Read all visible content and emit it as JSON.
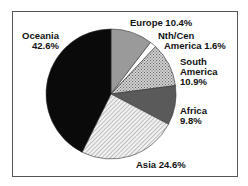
{
  "chart_data": {
    "type": "pie",
    "title": "",
    "categories": [
      "Oceania",
      "Europe",
      "Nth/Cen America",
      "South America",
      "Africa",
      "Asia"
    ],
    "values": [
      42.6,
      10.4,
      1.6,
      10.9,
      9.8,
      24.6
    ],
    "unit": "%",
    "labels": {
      "oceania": [
        "Oceania",
        "42.6%"
      ],
      "europe": [
        "Europe 10.4%"
      ],
      "nca": [
        "Nth/Cen",
        "America 1.6%"
      ],
      "south_america": [
        "South",
        "America",
        "10.9%"
      ],
      "africa": [
        "Africa",
        "9.8%"
      ],
      "asia": [
        "Asia 24.6%"
      ]
    },
    "fills": {
      "oceania": "#0a0a0a",
      "europe": "#9a9a9a",
      "nca": "#ffffff",
      "south_america": "crosshatch",
      "africa": "#5a5a5a",
      "asia": "diagonal-lines"
    },
    "legend": "none (direct labels)"
  }
}
